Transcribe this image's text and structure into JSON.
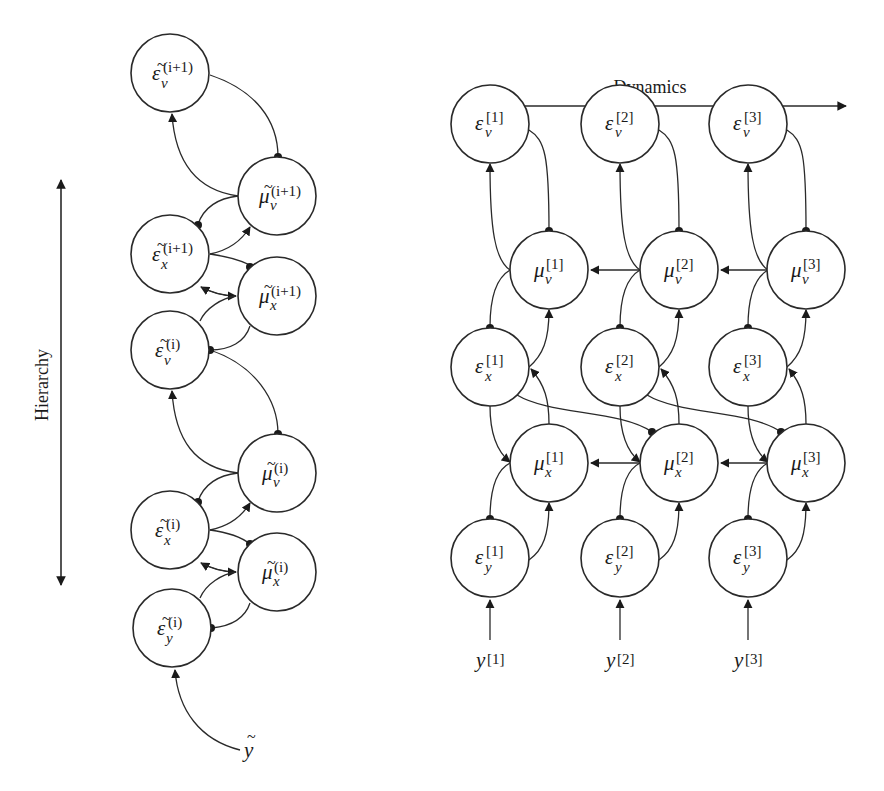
{
  "labels": {
    "hierarchy": "Hierarchy",
    "dynamics": "Dynamics"
  },
  "left_panel": {
    "nodes": [
      {
        "id": "eps_v_ip1",
        "symbol": "ε",
        "tilde": true,
        "sub": "v",
        "sup": "(i+1)"
      },
      {
        "id": "mu_v_ip1",
        "symbol": "μ",
        "tilde": true,
        "sub": "v",
        "sup": "(i+1)"
      },
      {
        "id": "eps_x_ip1",
        "symbol": "ε",
        "tilde": true,
        "sub": "x",
        "sup": "(i+1)"
      },
      {
        "id": "mu_x_ip1",
        "symbol": "μ",
        "tilde": true,
        "sub": "x",
        "sup": "(i+1)"
      },
      {
        "id": "eps_v_i",
        "symbol": "ε",
        "tilde": true,
        "sub": "v",
        "sup": "(i)"
      },
      {
        "id": "mu_v_i",
        "symbol": "μ",
        "tilde": true,
        "sub": "v",
        "sup": "(i)"
      },
      {
        "id": "eps_x_i",
        "symbol": "ε",
        "tilde": true,
        "sub": "x",
        "sup": "(i)"
      },
      {
        "id": "mu_x_i",
        "symbol": "μ",
        "tilde": true,
        "sub": "x",
        "sup": "(i)"
      },
      {
        "id": "eps_y_i",
        "symbol": "ε",
        "tilde": true,
        "sub": "y",
        "sup": "(i)"
      }
    ],
    "input": {
      "symbol": "y",
      "tilde": true
    }
  },
  "right_panel": {
    "columns": [
      {
        "index": "[1]",
        "nodes": [
          {
            "id": "eps_v_1",
            "symbol": "ε",
            "sub": "v",
            "sup": "[1]"
          },
          {
            "id": "mu_v_1",
            "symbol": "μ",
            "sub": "v",
            "sup": "[1]"
          },
          {
            "id": "eps_x_1",
            "symbol": "ε",
            "sub": "x",
            "sup": "[1]"
          },
          {
            "id": "mu_x_1",
            "symbol": "μ",
            "sub": "x",
            "sup": "[1]"
          },
          {
            "id": "eps_y_1",
            "symbol": "ε",
            "sub": "y",
            "sup": "[1]"
          }
        ],
        "input": {
          "symbol": "y",
          "sup": "[1]"
        }
      },
      {
        "index": "[2]",
        "nodes": [
          {
            "id": "eps_v_2",
            "symbol": "ε",
            "sub": "v",
            "sup": "[2]"
          },
          {
            "id": "mu_v_2",
            "symbol": "μ",
            "sub": "v",
            "sup": "[2]"
          },
          {
            "id": "eps_x_2",
            "symbol": "ε",
            "sub": "x",
            "sup": "[2]"
          },
          {
            "id": "mu_x_2",
            "symbol": "μ",
            "sub": "x",
            "sup": "[2]"
          },
          {
            "id": "eps_y_2",
            "symbol": "ε",
            "sub": "y",
            "sup": "[2]"
          }
        ],
        "input": {
          "symbol": "y",
          "sup": "[2]"
        }
      },
      {
        "index": "[3]",
        "nodes": [
          {
            "id": "eps_v_3",
            "symbol": "ε",
            "sub": "v",
            "sup": "[3]"
          },
          {
            "id": "mu_v_3",
            "symbol": "μ",
            "sub": "v",
            "sup": "[3]"
          },
          {
            "id": "eps_x_3",
            "symbol": "ε",
            "sub": "x",
            "sup": "[3]"
          },
          {
            "id": "mu_x_3",
            "symbol": "μ",
            "sub": "x",
            "sup": "[3]"
          },
          {
            "id": "eps_y_3",
            "symbol": "ε",
            "sub": "y",
            "sup": "[3]"
          }
        ],
        "input": {
          "symbol": "y",
          "sup": "[3]"
        }
      }
    ]
  },
  "colors": {
    "stroke": "#2a2a2a",
    "background": "#ffffff"
  }
}
